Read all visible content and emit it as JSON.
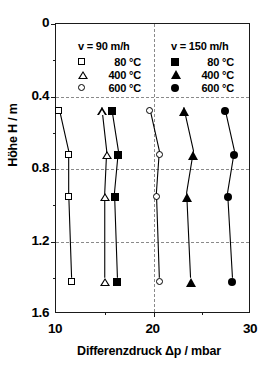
{
  "chart_data": {
    "type": "line",
    "title": "",
    "xlabel": "Differenzdruck Δp / mbar",
    "ylabel": "Höhe H / m",
    "xlim": [
      10,
      30
    ],
    "ylim": [
      0,
      1.6
    ],
    "y_inverted": true,
    "xticks": [
      10,
      20,
      30
    ],
    "xtick_labels": [
      "10",
      "20",
      "30"
    ],
    "yticks": [
      0,
      0.4,
      0.8,
      1.2,
      1.6
    ],
    "ytick_labels": [
      "0",
      "0.4",
      "0.8",
      "1.2",
      "1.6"
    ],
    "x_minor_ticks": [
      15,
      25
    ],
    "y_minor_ticks": [
      0.2,
      0.6,
      1.0,
      1.4
    ],
    "grid": "dashed gridlines at y = 0.4, 0.8, 1.2 and x = 20",
    "legend_position": "inside top, two columns",
    "marker_note": "open markers = v 90 m/h, filled markers = v 150 m/h",
    "x_axis_variable": "Differenzdruck",
    "y_axis_variable": "Höhe",
    "series": [
      {
        "name": "80 °C",
        "velocity": "90 m/h",
        "marker": "square-open",
        "x": [
          10.3,
          11.3,
          11.3,
          11.6
        ],
        "y": [
          0.46,
          0.7,
          0.93,
          1.4
        ]
      },
      {
        "name": "400 °C",
        "velocity": "90 m/h",
        "marker": "triangle-open",
        "x": [
          14.7,
          15.2,
          15.0,
          15.0
        ],
        "y": [
          0.46,
          0.7,
          0.93,
          1.4
        ]
      },
      {
        "name": "600 °C",
        "velocity": "90 m/h",
        "marker": "circle-open",
        "x": [
          19.6,
          20.6,
          20.3,
          20.6
        ],
        "y": [
          0.46,
          0.7,
          0.93,
          1.4
        ]
      },
      {
        "name": "80 °C",
        "velocity": "150 m/h",
        "marker": "square-filled",
        "x": [
          15.7,
          16.4,
          16.0,
          16.3
        ],
        "y": [
          0.46,
          0.7,
          0.93,
          1.4
        ]
      },
      {
        "name": "400 °C",
        "velocity": "150 m/h",
        "marker": "triangle-filled",
        "x": [
          23.1,
          24.1,
          23.4,
          23.8
        ],
        "y": [
          0.46,
          0.7,
          0.93,
          1.4
        ]
      },
      {
        "name": "600 °C",
        "velocity": "150 m/h",
        "marker": "circle-filled",
        "x": [
          27.3,
          28.3,
          27.6,
          28.1
        ],
        "y": [
          0.46,
          0.7,
          0.93,
          1.4
        ]
      }
    ]
  },
  "legend": {
    "left": {
      "header": "v = 90 m/h",
      "items": [
        {
          "label": "80 °C",
          "marker": "square-open"
        },
        {
          "label": "400 °C",
          "marker": "triangle-open"
        },
        {
          "label": "600 °C",
          "marker": "circle-open"
        }
      ]
    },
    "right": {
      "header": "v = 150 m/h",
      "items": [
        {
          "label": "80 °C",
          "marker": "square-filled"
        },
        {
          "label": "400 °C",
          "marker": "triangle-filled"
        },
        {
          "label": "600 °C",
          "marker": "circle-filled"
        }
      ]
    }
  },
  "colors": {
    "axis": "#1a1a1a",
    "grid": "#8a8a8a",
    "marker": "#000000",
    "background": "#ffffff"
  }
}
